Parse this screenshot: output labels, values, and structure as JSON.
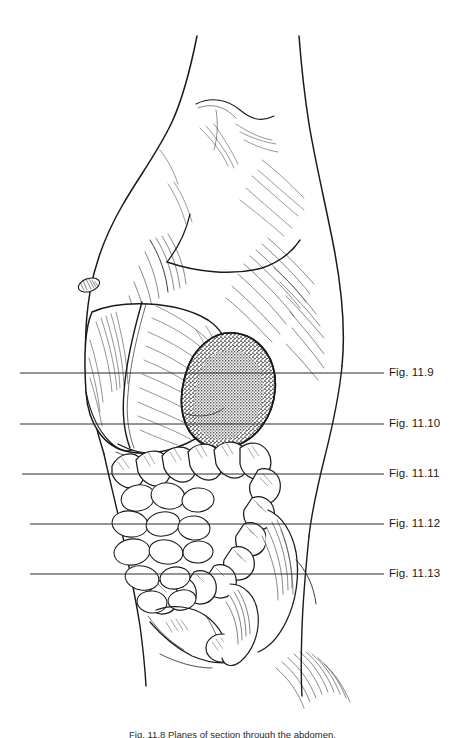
{
  "figure": {
    "domain": "anatomical-illustration",
    "background_color": "#ffffff",
    "ink_color": "#1a1a1a",
    "width": 465,
    "height": 738,
    "caption": "Fig. 11.8  Planes of section through the abdomen.",
    "caption_clipped": true
  },
  "leader_labels": [
    {
      "text": "Fig. 11.9",
      "y": 373,
      "line_x1": 20,
      "line_x2": 384,
      "label_x": 389
    },
    {
      "text": "Fig. 11.10",
      "y": 424,
      "line_x1": 20,
      "line_x2": 384,
      "label_x": 389
    },
    {
      "text": "Fig. 11.11",
      "y": 474,
      "line_x1": 22,
      "line_x2": 384,
      "label_x": 389
    },
    {
      "text": "Fig. 11.12",
      "y": 524,
      "line_x1": 30,
      "line_x2": 384,
      "label_x": 389
    },
    {
      "text": "Fig. 11.13",
      "y": 574,
      "line_x1": 30,
      "line_x2": 384,
      "label_x": 389
    }
  ],
  "anatomy": {
    "body_outline_name": "torso-outline",
    "features": [
      {
        "name": "pectoral-muscle",
        "label": "Pectoral muscle"
      },
      {
        "name": "nipple",
        "label": "Nipple"
      },
      {
        "name": "rib-cage-hatching",
        "label": "Rib cage"
      },
      {
        "name": "liver",
        "label": "Liver"
      },
      {
        "name": "stomach",
        "label": "Stomach"
      },
      {
        "name": "spleen-stippled",
        "label": "Spleen"
      },
      {
        "name": "transverse-colon",
        "label": "Transverse colon"
      },
      {
        "name": "descending-colon",
        "label": "Descending colon"
      },
      {
        "name": "sigmoid-colon",
        "label": "Sigmoid colon"
      },
      {
        "name": "small-intestine",
        "label": "Small intestine"
      },
      {
        "name": "pelvis-bone",
        "label": "Pelvic bone"
      },
      {
        "name": "bladder",
        "label": "Bladder"
      },
      {
        "name": "gluteal-muscle",
        "label": "Gluteal muscle"
      },
      {
        "name": "thigh",
        "label": "Thigh"
      }
    ]
  }
}
